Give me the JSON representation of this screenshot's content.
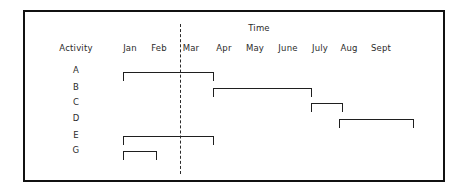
{
  "figure": {
    "title": "Time",
    "activity_header": "Activity",
    "background_color": "#ffffff",
    "line_color": "#1f1f1f",
    "frame_color": "#111111"
  },
  "chart_data": {
    "type": "bar",
    "subtype": "gantt",
    "title": "Time",
    "xlabel": "Time",
    "ylabel": "Activity",
    "grid": false,
    "legend": null,
    "categories": [
      "A",
      "B",
      "C",
      "D",
      "E",
      "G"
    ],
    "x_tick_labels": [
      "Jan",
      "Feb",
      "Mar",
      "Apr",
      "May",
      "June",
      "July",
      "Aug",
      "Sept"
    ],
    "x_tick_values": [
      1,
      2,
      3,
      4,
      5,
      6,
      7,
      8,
      9
    ],
    "xlim": [
      0.5,
      10.0
    ],
    "annotations": [
      {
        "name": "milestone-dashed-line",
        "style": "dashed-vertical",
        "x_value": 2.5,
        "label": ""
      }
    ],
    "tasks": [
      {
        "activity": "A",
        "start_label": "Jan",
        "end_label": "Mar",
        "start": 1.0,
        "end": 3.5
      },
      {
        "activity": "B",
        "start_label": "Mar",
        "end_label": "June",
        "start": 3.5,
        "end": 6.4
      },
      {
        "activity": "C",
        "start_label": "June",
        "end_label": "July",
        "start": 6.3,
        "end": 7.2
      },
      {
        "activity": "D",
        "start_label": "July",
        "end_label": "Sept",
        "start": 7.1,
        "end": 9.3
      },
      {
        "activity": "E",
        "start_label": "Jan",
        "end_label": "Mar",
        "start": 1.0,
        "end": 3.5
      },
      {
        "activity": "G",
        "start_label": "Jan",
        "end_label": "Feb",
        "start": 1.0,
        "end": 2.0
      }
    ]
  },
  "layout": {
    "title_x": 257,
    "title_y": 22,
    "activity_header_x": 74,
    "activity_header_y": 42,
    "month_label_y": 42,
    "month_label_x": [
      128,
      157,
      189,
      222,
      253,
      286,
      318,
      347,
      379
    ],
    "milestone_x": 178,
    "milestone_top": 22,
    "milestone_height": 150,
    "row_label_x": 74,
    "row_label_y": [
      68,
      85,
      100,
      116,
      133,
      148
    ],
    "bars": [
      {
        "left": 121,
        "width": 91,
        "top": 70
      },
      {
        "left": 211,
        "width": 99,
        "top": 86
      },
      {
        "left": 309,
        "width": 32,
        "top": 101
      },
      {
        "left": 337,
        "width": 75,
        "top": 117
      },
      {
        "left": 121,
        "width": 91,
        "top": 134
      },
      {
        "left": 121,
        "width": 34,
        "top": 149
      }
    ]
  }
}
